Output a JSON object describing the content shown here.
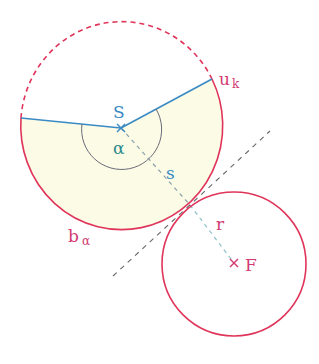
{
  "diagram": {
    "colors": {
      "circle": "#e0355a",
      "radius_lines": "#3a8ac4",
      "fill": "#fbfbe6",
      "dashed_line": "#666666",
      "s_line": "#8aa0aa",
      "r_line": "#8cc0cc",
      "alpha_arc": "#6a6a7a",
      "label_pink": "#d23c72",
      "label_blue": "#3a8ac4",
      "label_alpha": "#2a8a8a"
    },
    "labels": {
      "S": "S",
      "alpha": "α",
      "s": "s",
      "uk_main": "u",
      "uk_sub": "k",
      "b_main": "b",
      "b_sub": "α",
      "r": "r",
      "F": "F"
    },
    "points": {
      "S": [
        121,
        128
      ],
      "F": [
        234,
        263
      ],
      "tangent_point": [
        190,
        205
      ]
    },
    "big_circle": {
      "cx": 122,
      "cy": 126,
      "rx": 101,
      "ry": 104
    },
    "small_circle": {
      "cx": 234,
      "cy": 264,
      "r": 72
    }
  }
}
